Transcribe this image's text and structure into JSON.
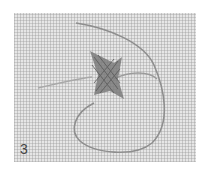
{
  "image": {
    "description": "Close-up photo of a small embroidered cross-stitch/woven motif on even-weave linen fabric with a loose thread looping around",
    "step_number": "3",
    "colors": {
      "fabric": "#e6e6e6",
      "thread": "#8a8a8a",
      "motif": "#6e6e6e",
      "label": "#444444"
    }
  }
}
